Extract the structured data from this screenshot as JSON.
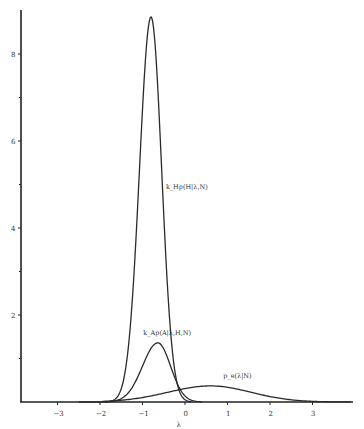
{
  "chart_data": {
    "type": "line",
    "title": "",
    "xlabel": "λ",
    "ylabel": "",
    "xlim": [
      -3.9,
      3.95
    ],
    "ylim": [
      0,
      9
    ],
    "x_ticks": [
      -3,
      -2,
      -1,
      0,
      1,
      2,
      3
    ],
    "x_tick_labels": [
      "−3",
      "−2",
      "−1",
      "0",
      "1",
      "2",
      "3"
    ],
    "y_ticks_major": [
      2,
      4,
      6,
      8
    ],
    "y_tick_labels": [
      "2",
      "4",
      "6",
      "8"
    ],
    "y_ticks_minor": [
      1,
      3,
      5,
      7
    ],
    "grid": false,
    "series": [
      {
        "name": "k_H p(H|λ,N)",
        "label": "k_Hp(H|λ,N)",
        "shape": "gaussian",
        "peak_x": -0.8,
        "peak_y": 8.85,
        "sigma_left": 0.27,
        "sigma_right": 0.25,
        "x_range": [
          -2.5,
          0.15
        ]
      },
      {
        "name": "k_A p(A|λ,H,N)",
        "label": "k_Ap(A|λ,H,N)",
        "shape": "gaussian",
        "peak_x": -0.64,
        "peak_y": 1.36,
        "sigma_left": 0.36,
        "sigma_right": 0.3,
        "x_range": [
          -1.95,
          0.4
        ]
      },
      {
        "name": "p_e(λ|N)",
        "label": "p_e(λ|N)",
        "shape": "gaussian",
        "peak_x": 0.6,
        "peak_y": 0.37,
        "sigma_left": 1.0,
        "sigma_right": 0.95,
        "x_range": [
          -1.95,
          3.9
        ]
      }
    ]
  }
}
